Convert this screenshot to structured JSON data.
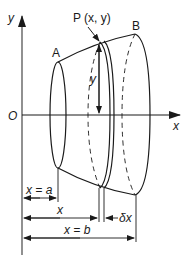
{
  "diagram": {
    "type": "solid-of-revolution",
    "colors": {
      "stroke": "#1a1a1a",
      "background": "#ffffff"
    },
    "axes": {
      "y_label": "y",
      "x_label": "x",
      "origin_label": "O"
    },
    "points": {
      "A": "A",
      "B": "B",
      "P": "P (x, y)"
    },
    "annotations": {
      "height": "y",
      "dim_a": "x = a",
      "dim_x": "x",
      "dim_dx": "δx",
      "dim_b": "x = b"
    }
  }
}
